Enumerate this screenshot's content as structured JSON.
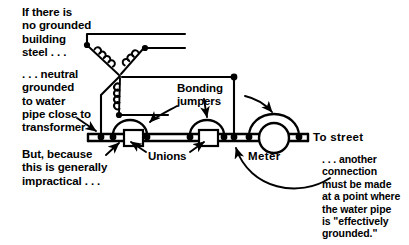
{
  "figure": {
    "stroke_color": "#000000",
    "background_color": "#ffffff"
  },
  "annotations": {
    "no_building_steel": "If there is\nno grounded\nbuilding\nsteel . . .",
    "neutral_grounded": ". . . neutral\ngrounded\nto water\npipe close to\ntransformer",
    "but_impractical": "But, because\nthis is generally\nimpractical . . .",
    "bonding_jumpers": "Bonding\njumpers",
    "unions": "Unions",
    "meter": "Meter",
    "to_street": "To street",
    "another_connection": ". . . another\nconnection\nmust be made\nat a point where\nthe water pipe\nis \"effectively\ngrounded.\""
  },
  "components": {
    "transformer": {
      "type": "wye-winding",
      "coil_count": 3,
      "coil_labels": [
        "phase-a-coil",
        "phase-b-coil",
        "phase-c-coil"
      ],
      "neutral_point": "center-tap"
    },
    "water_pipe": {
      "union_count": 2,
      "meter_count": 1,
      "jumper_count": 3
    },
    "conductors": {
      "grounding_electrode_conductor": 1,
      "bonding_jumper_arcs": 3,
      "service_conductors": 3
    }
  }
}
